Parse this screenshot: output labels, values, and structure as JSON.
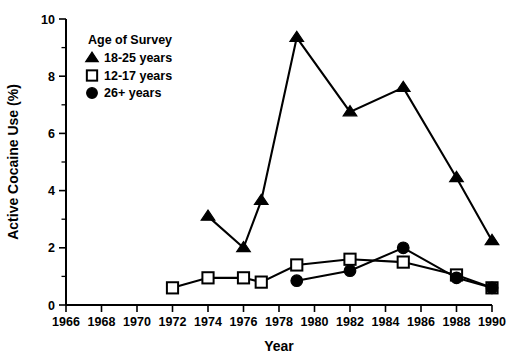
{
  "chart_data": {
    "type": "line",
    "title": "",
    "xlabel": "Year",
    "ylabel": "Active Cocaine Use (%)",
    "xlim": [
      1966,
      1990
    ],
    "ylim": [
      0,
      10
    ],
    "x_ticks": [
      1966,
      1968,
      1970,
      1972,
      1974,
      1976,
      1978,
      1980,
      1982,
      1984,
      1986,
      1988,
      1990
    ],
    "x_tick_labels": [
      "1966",
      "1968",
      "1970",
      "1972",
      "1974",
      "1976",
      "1978",
      "1980",
      "1982",
      "1984",
      "1986",
      "1988",
      "1990"
    ],
    "y_ticks": [
      0,
      2,
      4,
      6,
      8,
      10
    ],
    "y_tick_labels": [
      "0",
      "2",
      "4",
      "6",
      "8",
      "10"
    ],
    "y_minor_ticks": [
      1,
      3,
      5,
      7,
      9
    ],
    "grid": false,
    "legend_position": "upper-left-inside",
    "legend_title": "Age of Survey",
    "series": [
      {
        "name": "18-25 years",
        "marker": "triangle-up-filled",
        "x": [
          1974,
          1976,
          1977,
          1979,
          1982,
          1985,
          1988,
          1990
        ],
        "values": [
          3.1,
          2.0,
          3.65,
          9.35,
          6.75,
          7.6,
          4.45,
          2.25
        ]
      },
      {
        "name": "12-17 years",
        "marker": "square-open",
        "x": [
          1972,
          1974,
          1976,
          1977,
          1979,
          1982,
          1985,
          1988,
          1990
        ],
        "values": [
          0.6,
          0.95,
          0.95,
          0.8,
          1.4,
          1.6,
          1.5,
          1.05,
          0.6
        ]
      },
      {
        "name": "26+ years",
        "marker": "circle-filled",
        "x": [
          1979,
          1982,
          1985,
          1988,
          1990
        ],
        "values": [
          0.85,
          1.2,
          2.0,
          0.95,
          0.6
        ]
      }
    ],
    "colors": {
      "line": "#000000",
      "marker_fill": "#000000",
      "marker_open_fill": "#ffffff",
      "background": "#ffffff",
      "axis": "#000000"
    }
  },
  "legend": {
    "title": "Age of Survey",
    "entries": [
      {
        "label": "18-25 years",
        "marker": "triangle-up-filled"
      },
      {
        "label": "12-17 years",
        "marker": "square-open"
      },
      {
        "label": "26+ years",
        "marker": "circle-filled"
      }
    ]
  },
  "axes": {
    "x_title": "Year",
    "y_title": "Active Cocaine Use (%)"
  }
}
